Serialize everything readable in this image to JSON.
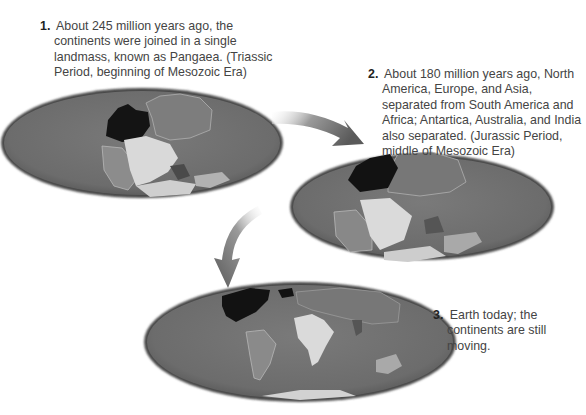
{
  "figure": {
    "stages": [
      {
        "number": "1.",
        "text": "About 245 million years ago, the continents were joined in a single landmass, known as Pangaea. (Triassic Period, beginning of Mesozoic Era)"
      },
      {
        "number": "2.",
        "text": "About 180 million years ago, North America, Europe, and Asia, separated from South America and Africa; Antartica, Australia, and India also separated. (Jurassic Period, middle of Mesozoic Era)"
      },
      {
        "number": "3.",
        "text": "Earth today; the continents are still moving."
      }
    ],
    "colors": {
      "ocean": "#6f6f6f",
      "north_america": "#161616",
      "eurasia": "#7a7a7a",
      "south_america": "#8c8c8c",
      "africa": "#d8d8d8",
      "india": "#4e4e4e",
      "australia": "#a8a8a8",
      "antarctica": "#cfcfcf",
      "arrow": "#5e5e5e"
    }
  }
}
